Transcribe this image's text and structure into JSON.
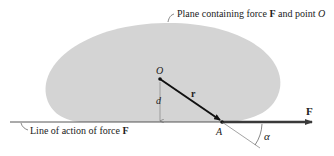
{
  "figure": {
    "plane_label": {
      "prefix": "Plane containing force ",
      "force": "F",
      "middle": " and point ",
      "point": "O"
    },
    "line_label": {
      "prefix": "Line of action of force ",
      "force": "F"
    },
    "point_O": "O",
    "point_A": "A",
    "vector_r": "r",
    "distance_d": "d",
    "force_F": "F",
    "angle_alpha": "α",
    "colors": {
      "plane": "#d4d4d4",
      "line": "#333333",
      "arrow": "#3a3a3a"
    }
  }
}
